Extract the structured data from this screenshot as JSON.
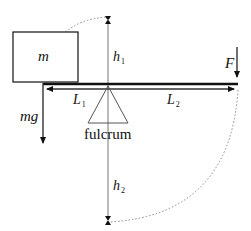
{
  "labels": {
    "mass": "m",
    "weight": "mg",
    "force": "F",
    "height_top": {
      "base": "h",
      "sub": "1"
    },
    "height_bottom": {
      "base": "h",
      "sub": "2"
    },
    "arm_left": {
      "base": "L",
      "sub": "1"
    },
    "arm_right": {
      "base": "L",
      "sub": "2"
    },
    "fulcrum": "fulcrum"
  },
  "colors": {
    "ink": "#111111",
    "thin_line": "#777777",
    "dotted": "#888888"
  }
}
